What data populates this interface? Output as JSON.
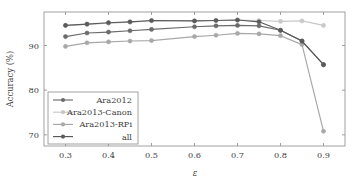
{
  "chart_data": {
    "type": "line",
    "title": "",
    "xlabel": "ε",
    "ylabel": "Accuracy (%)",
    "xlim": [
      0.25,
      0.95
    ],
    "ylim": [
      67.5,
      97.5
    ],
    "xticks": [
      0.3,
      0.4,
      0.5,
      0.6,
      0.7,
      0.8,
      0.9
    ],
    "xtick_labels": [
      "0.3",
      "0.4",
      "0.5",
      "0.6",
      "0.7",
      "0.8",
      "0.9"
    ],
    "yticks": [
      70,
      80,
      90
    ],
    "ytick_labels": [
      "70",
      "80",
      "90"
    ],
    "grid": false,
    "legend_position": "lower-left",
    "series": [
      {
        "name": "Ara2012",
        "color": "#6b6b6b",
        "x": [
          0.3,
          0.35,
          0.4,
          0.45,
          0.5,
          0.6,
          0.65,
          0.7,
          0.75,
          0.8,
          0.85,
          0.9
        ],
        "values": [
          92.0,
          92.8,
          93.0,
          93.3,
          93.6,
          94.2,
          94.4,
          94.5,
          94.4,
          93.4,
          91.0,
          85.7
        ]
      },
      {
        "name": "Ara2013-Canon",
        "color": "#c9c9c9",
        "x": [
          0.3,
          0.35,
          0.4,
          0.45,
          0.5,
          0.6,
          0.65,
          0.7,
          0.75,
          0.8,
          0.85,
          0.9
        ],
        "values": [
          94.5,
          94.7,
          95.0,
          95.2,
          95.5,
          95.5,
          95.6,
          95.7,
          95.6,
          95.4,
          95.5,
          94.5
        ]
      },
      {
        "name": "Ara2013-RPi",
        "color": "#a8a8a8",
        "x": [
          0.3,
          0.35,
          0.4,
          0.45,
          0.5,
          0.6,
          0.65,
          0.7,
          0.75,
          0.8,
          0.85,
          0.9
        ],
        "values": [
          89.8,
          90.6,
          90.8,
          91.0,
          91.1,
          92.0,
          92.3,
          92.7,
          92.6,
          92.2,
          90.2,
          70.8
        ]
      },
      {
        "name": "all",
        "color": "#5a5a5a",
        "x": [
          0.3,
          0.35,
          0.4,
          0.45,
          0.5,
          0.6,
          0.65,
          0.7,
          0.75,
          0.8,
          0.85,
          0.9
        ],
        "values": [
          94.5,
          94.8,
          95.1,
          95.3,
          95.6,
          95.5,
          95.6,
          95.7,
          95.3,
          93.4,
          91.0,
          85.7
        ]
      }
    ],
    "legend_entries": [
      "Ara2012",
      "Ara2013-Canon",
      "Ara2013-RPi",
      "all"
    ]
  }
}
